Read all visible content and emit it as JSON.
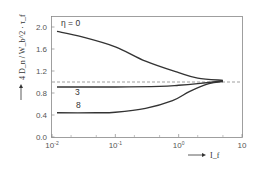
{
  "chart_data": {
    "type": "line",
    "title": "",
    "xlabel": "I_f",
    "ylabel": "4 D_n / W_b^2 · τ_f",
    "xscale": "log",
    "xlim": [
      0.01,
      10
    ],
    "ylim": [
      0.0,
      2.2
    ],
    "grid": false,
    "legend": "none",
    "x_ticks": [
      {
        "value": 0.01,
        "base": "10",
        "exp": "-2"
      },
      {
        "value": 0.1,
        "base": "10",
        "exp": "-1"
      },
      {
        "value": 1,
        "base": "10",
        "exp": "0"
      },
      {
        "value": 10,
        "base": "10",
        "exp": ""
      }
    ],
    "y_ticks": [
      {
        "value": 0.0,
        "label": "0.0"
      },
      {
        "value": 0.4,
        "label": "0.4"
      },
      {
        "value": 0.8,
        "label": "0.8"
      },
      {
        "value": 1.2,
        "label": "1.2"
      },
      {
        "value": 1.6,
        "label": "1.6"
      },
      {
        "value": 2.0,
        "label": "2.0"
      }
    ],
    "reference_line": {
      "y": 1.0,
      "style": "dashed"
    },
    "series": [
      {
        "name": "η = 0",
        "label": "η = 0",
        "x": [
          0.012,
          0.03,
          0.1,
          0.3,
          1.0,
          2.0,
          5.0
        ],
        "y": [
          1.92,
          1.82,
          1.64,
          1.38,
          1.17,
          1.07,
          1.03
        ]
      },
      {
        "name": "η = 3",
        "label": "3",
        "x": [
          0.012,
          0.1,
          0.5,
          1.0,
          2.0,
          5.0
        ],
        "y": [
          0.91,
          0.91,
          0.92,
          0.94,
          0.97,
          1.02
        ]
      },
      {
        "name": "η = 8",
        "label": "8",
        "x": [
          0.012,
          0.05,
          0.1,
          0.3,
          0.8,
          1.5,
          3.0,
          5.0
        ],
        "y": [
          0.44,
          0.44,
          0.45,
          0.52,
          0.66,
          0.83,
          0.97,
          1.01
        ]
      }
    ]
  }
}
